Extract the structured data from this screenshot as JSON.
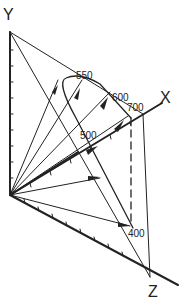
{
  "diagram": {
    "type": "3d-color-space-spectral-locus",
    "axes": {
      "x_label": "X",
      "y_label": "Y",
      "z_label": "Z"
    },
    "wavelength_labels": [
      "400",
      "500",
      "550",
      "600",
      "700"
    ],
    "colors": {
      "ink": "#222222",
      "background": "#ffffff"
    }
  }
}
